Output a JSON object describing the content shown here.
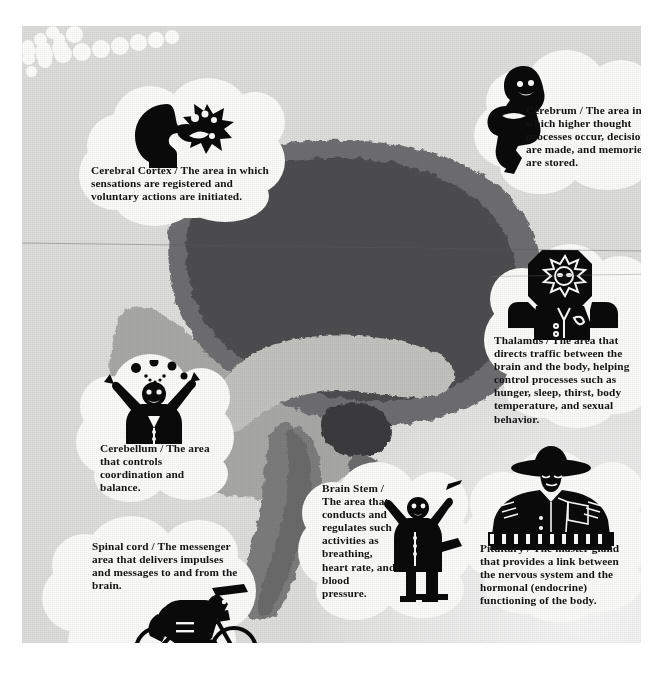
{
  "figure": {
    "medium": "scanned textbook page illustration"
  },
  "brain": {
    "regions": [
      {
        "name": "cerebrum",
        "tone": "#4f4f51",
        "note": "large dark upper mass"
      },
      {
        "name": "cerebral-cortex",
        "tone": "#6f6f71",
        "note": "outer rim band"
      },
      {
        "name": "corpus-callosum",
        "tone": "#b9b9b7",
        "note": "light curved band"
      },
      {
        "name": "thalamus",
        "tone": "#3a3a3c",
        "note": "small dark oval center"
      },
      {
        "name": "cerebellum",
        "tone": "#9a9a99",
        "note": "lower left pale mass"
      },
      {
        "name": "brain-stem",
        "tone": "#7b7b7c",
        "note": "descending column"
      },
      {
        "name": "pituitary",
        "tone": "#6b6b6d",
        "note": "small nub below thalamus"
      }
    ]
  },
  "callouts": [
    {
      "id": "cerebral-cortex",
      "term": "Cerebral Cortex",
      "separator": "/",
      "description": "The area in which sensations are registered and voluntary actions are initiated.",
      "full_text": "Cerebral Cortex / The area in which sensations are registered and voluntary actions are initiated.",
      "art": "head-profile-burst-icon",
      "art_description": "silhouette of a head in profile with a starburst of sensation"
    },
    {
      "id": "cerebrum",
      "term": "Cerebrum",
      "separator": "/",
      "description": "The area in which higher thought processes occur, decisions are made, and memories are stored.",
      "full_text": "Cerebrum / The area in which higher thought processes occur, decisions are made, and memories are stored.",
      "art": "seated-thinker-icon",
      "art_description": "silhouette of a seated woman thinking, chin on hand"
    },
    {
      "id": "thalamus",
      "term": "Thalamus",
      "separator": "/",
      "description": "The area that directs traffic between the brain and the body, helping control processes such as hunger, sleep, thirst, body temperature, and sexual behavior.",
      "full_text": "Thalamus / The area that directs traffic between the brain and the body, helping control processes such as hunger, sleep, thirst, body temperature, and sexual behavior.",
      "art": "traffic-officer-icon",
      "art_description": "silhouette of a traffic officer in a helmet directing traffic"
    },
    {
      "id": "cerebellum",
      "term": "Cerebellum",
      "separator": "/",
      "description": "The area that controls coordination and balance.",
      "full_text": "Cerebellum / The area that controls coordination and balance.",
      "art": "juggler-icon",
      "art_description": "silhouette of a juggler tossing balls"
    },
    {
      "id": "brain-stem",
      "term": "Brain Stem",
      "separator": "/",
      "description": "The area that conducts and regulates such activities as breathing, heart rate, and blood pressure.",
      "full_text": "Brain Stem / The area that conducts and regulates such activities as breathing, heart rate, and blood pressure.",
      "art": "orchestra-conductor-icon",
      "art_description": "silhouette of a conductor with baton at a music stand"
    },
    {
      "id": "pituitary",
      "term": "Pituitary",
      "separator": "/",
      "description": "The master gland that provides a link between the nervous system and the hormonal (endocrine) functioning of the body.",
      "full_text": "Pituitary / The master gland that provides a link between the nervous system and the hormonal (endocrine) functioning of the body.",
      "art": "uniformed-officer-icon",
      "art_description": "silhouette of a uniformed master-sergeant figure with a wide hat"
    },
    {
      "id": "spinal-cord",
      "term": "Spinal cord",
      "separator": "/",
      "description": "The messenger area that delivers impulses and messages to and from the brain.",
      "full_text": "Spinal cord / The messenger area that delivers impulses and messages to and from the brain.",
      "art": "bicycle-messenger-icon",
      "art_description": "silhouette of a bike messenger riding with a satchel"
    }
  ]
}
